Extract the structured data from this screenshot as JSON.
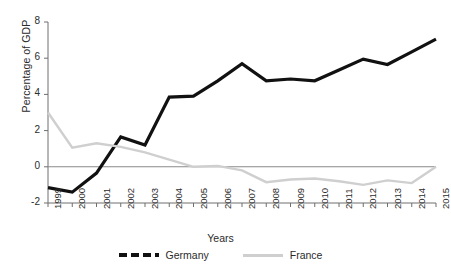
{
  "chart_data": {
    "type": "line",
    "title": "",
    "xlabel": "Years",
    "ylabel": "Percentage of GDP",
    "categories": [
      "1999",
      "2000",
      "2001",
      "2002",
      "2003",
      "2004",
      "2005",
      "2006",
      "2007",
      "2008",
      "2009",
      "2010",
      "2011",
      "2012",
      "2013",
      "2014",
      "2015"
    ],
    "x": [
      1999,
      2000,
      2001,
      2002,
      2003,
      2004,
      2005,
      2006,
      2007,
      2008,
      2009,
      2010,
      2011,
      2012,
      2013,
      2014,
      2015
    ],
    "ylim": [
      -2,
      8
    ],
    "yticks": [
      -2,
      0,
      2,
      4,
      6,
      8
    ],
    "ytick_labels": [
      "-2",
      "0",
      "2",
      "4",
      "6",
      "8"
    ],
    "grid": false,
    "legend_position": "bottom",
    "zero_line": true,
    "series": [
      {
        "name": "Germany",
        "color": "#111111",
        "style": "dashed",
        "values": [
          -1.15,
          -1.4,
          -0.35,
          1.65,
          1.2,
          3.85,
          3.9,
          4.75,
          5.7,
          4.75,
          4.85,
          4.75,
          5.35,
          5.95,
          5.65,
          6.35,
          7.05
        ]
      },
      {
        "name": "France",
        "color": "#cfcfcf",
        "style": "solid",
        "values": [
          3.0,
          1.05,
          1.3,
          1.1,
          0.8,
          0.4,
          0.0,
          0.05,
          -0.2,
          -0.85,
          -0.7,
          -0.65,
          -0.8,
          -1.0,
          -0.75,
          -0.9,
          0.0
        ]
      }
    ]
  },
  "legend": {
    "items": [
      {
        "label": "Germany",
        "style": "dashed"
      },
      {
        "label": "France",
        "style": "solid"
      }
    ]
  },
  "colors": {
    "germany": "#111111",
    "france": "#cfcfcf",
    "axis": "#6e6e6e",
    "text": "#2b2b2b"
  }
}
